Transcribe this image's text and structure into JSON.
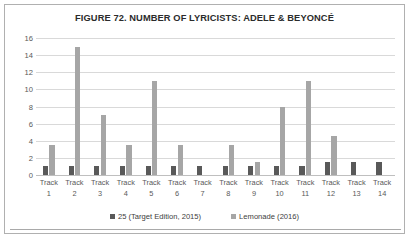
{
  "chart_data": {
    "type": "bar",
    "title": "FIGURE 72. NUMBER OF LYRICISTS: ADELE & BEYONCÉ",
    "xlabel": "",
    "ylabel": "",
    "ylim": [
      0,
      16
    ],
    "yticks": [
      16,
      14,
      12,
      10,
      8,
      6,
      4,
      2,
      0
    ],
    "grid": true,
    "legend_position": "bottom",
    "categories": [
      "Track 1",
      "Track 2",
      "Track 3",
      "Track 4",
      "Track 5",
      "Track 6",
      "Track 7",
      "Track 8",
      "Track 9",
      "Track 10",
      "Track 11",
      "Track 12",
      "Track 13",
      "Track 14"
    ],
    "category_lines": [
      [
        "Track",
        "1"
      ],
      [
        "Track",
        "2"
      ],
      [
        "Track",
        "3"
      ],
      [
        "Track",
        "4"
      ],
      [
        "Track",
        "5"
      ],
      [
        "Track",
        "6"
      ],
      [
        "Track",
        "7"
      ],
      [
        "Track",
        "8"
      ],
      [
        "Track",
        "9"
      ],
      [
        "Track",
        "10"
      ],
      [
        "Track",
        "11"
      ],
      [
        "Track",
        "12"
      ],
      [
        "Track",
        "13"
      ],
      [
        "Track",
        "14"
      ]
    ],
    "series": [
      {
        "name": "25 (Target Edition, 2015)",
        "color": "#595959",
        "values": [
          1,
          1,
          1,
          1,
          1,
          1,
          1,
          1,
          1,
          1,
          1,
          1.5,
          1.5,
          1.5
        ]
      },
      {
        "name": "Lemonade (2016)",
        "color": "#a6a6a6",
        "values": [
          3.5,
          15,
          7,
          3.5,
          11,
          3.5,
          0,
          3.5,
          1.5,
          8,
          11,
          4.5,
          0,
          0
        ]
      }
    ]
  },
  "legend": {
    "items": [
      {
        "label": "25 (Target Edition, 2015)",
        "color": "#595959"
      },
      {
        "label": "Lemonade (2016)",
        "color": "#a6a6a6"
      }
    ]
  }
}
